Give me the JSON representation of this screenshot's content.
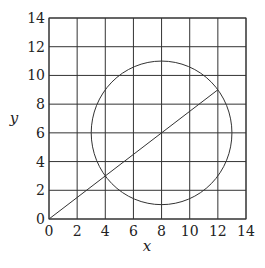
{
  "chart_data": {
    "type": "line",
    "title": "",
    "xlabel": "x",
    "ylabel": "y",
    "xlim": [
      0,
      14
    ],
    "ylim": [
      0,
      14
    ],
    "grid": true,
    "x_ticks": [
      0,
      2,
      4,
      6,
      8,
      10,
      12,
      14
    ],
    "y_ticks": [
      0,
      2,
      4,
      6,
      8,
      10,
      12,
      14
    ],
    "legend": [],
    "series": [
      {
        "name": "circle",
        "kind": "circle",
        "center": [
          8,
          6
        ],
        "radius": 5
      },
      {
        "name": "line",
        "kind": "segment",
        "x": [
          0,
          12
        ],
        "y": [
          0,
          9
        ]
      }
    ],
    "intersections": [
      [
        4,
        3
      ],
      [
        12,
        9
      ]
    ]
  },
  "labels": {
    "x_axis": "x",
    "y_axis": "y"
  }
}
